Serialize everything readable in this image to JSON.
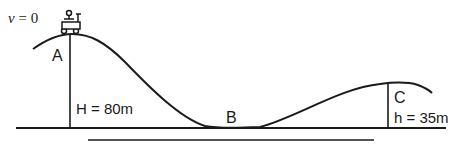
{
  "diagram": {
    "type": "roller-coaster-energy-diagram",
    "initial_velocity": {
      "symbol": "v",
      "equals": "= 0"
    },
    "points": [
      {
        "id": "A",
        "label": "A"
      },
      {
        "id": "B",
        "label": "B"
      },
      {
        "id": "C",
        "label": "C"
      }
    ],
    "heights": {
      "A": {
        "label": "H = 80m"
      },
      "C": {
        "label": "h = 35m"
      }
    },
    "object": "cart-icon",
    "colors": {
      "line": "#1a1a1a",
      "background": "#ffffff"
    }
  }
}
